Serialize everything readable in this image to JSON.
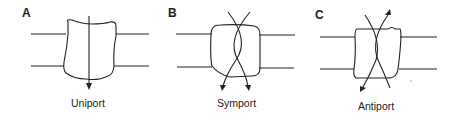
{
  "diagram": {
    "panels": [
      {
        "letter": "A",
        "caption": "Uniport"
      },
      {
        "letter": "B",
        "caption": "Symport"
      },
      {
        "letter": "C",
        "caption": "Antiport"
      }
    ],
    "stroke_color": "#222222"
  }
}
